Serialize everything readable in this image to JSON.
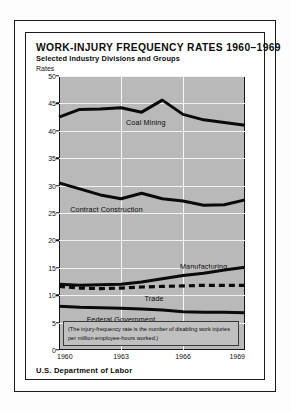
{
  "chart_data": {
    "type": "line",
    "title": "WORK-INJURY FREQUENCY RATES 1960–1969",
    "subtitle": "Selected Industry Divisions and Groups",
    "ylabel": "Rates",
    "xlabel": "",
    "ylim": [
      0,
      50
    ],
    "xlim": [
      1960,
      1969
    ],
    "grid": true,
    "legend_position": "inline-labels",
    "yticks": [
      0,
      5,
      10,
      15,
      20,
      25,
      30,
      35,
      40,
      45,
      50
    ],
    "xticks": [
      1960,
      1963,
      1966,
      1969
    ],
    "xtick_labels": [
      "1960",
      "1963",
      "1966",
      "1969"
    ],
    "x": [
      1960,
      1961,
      1962,
      1963,
      1964,
      1965,
      1966,
      1967,
      1968,
      1969
    ],
    "series": [
      {
        "name": "Coal Mining",
        "style": "solid",
        "values": [
          42.5,
          43.9,
          44.0,
          44.2,
          43.4,
          45.6,
          43.0,
          42.0,
          41.5,
          41.0
        ]
      },
      {
        "name": "Contract Construction",
        "style": "solid",
        "values": [
          30.5,
          29.4,
          28.3,
          27.6,
          28.6,
          27.6,
          27.2,
          26.4,
          26.5,
          27.4
        ]
      },
      {
        "name": "Manufacturing",
        "style": "solid",
        "values": [
          12.0,
          11.8,
          11.9,
          12.0,
          12.4,
          13.0,
          13.6,
          14.0,
          14.6,
          15.1
        ]
      },
      {
        "name": "Trade",
        "style": "dashed",
        "values": [
          11.6,
          11.3,
          11.2,
          11.3,
          11.5,
          11.6,
          11.7,
          11.8,
          11.8,
          11.8
        ]
      },
      {
        "name": "Federal Government",
        "style": "solid",
        "values": [
          8.0,
          7.8,
          7.7,
          7.6,
          7.5,
          7.3,
          7.0,
          6.9,
          6.9,
          6.8
        ]
      }
    ],
    "annotations": [
      "(The injury-frequency rate is the number of disabling work injuries per million employee-hours worked.)"
    ]
  },
  "footnote": {
    "line1": "(The injury-frequency rate is the number of disabling work",
    "line2": "injuries per million employee-hours worked.)"
  },
  "source": "U.S. Department of Labor"
}
